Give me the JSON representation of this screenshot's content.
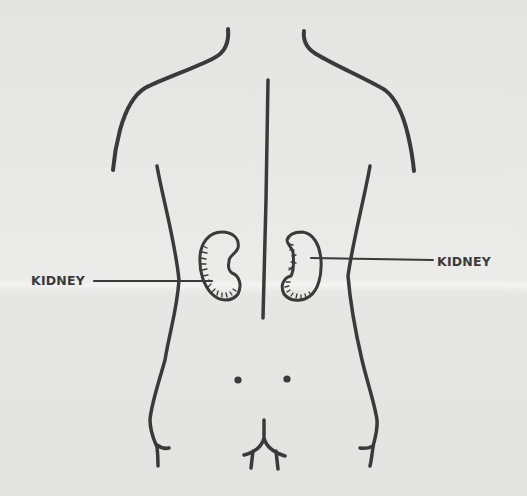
{
  "diagram": {
    "labels": {
      "left": "KIDNEY",
      "right": "KIDNEY"
    },
    "colors": {
      "background": "#e6e6e4",
      "ink": "#3a3a3a"
    }
  }
}
